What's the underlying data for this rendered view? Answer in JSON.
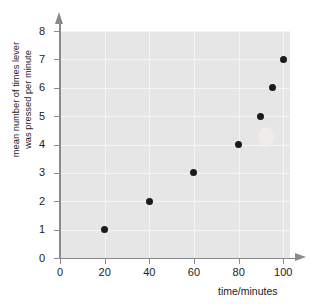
{
  "chart_data": {
    "type": "scatter",
    "title": "",
    "xlabel": "time/minutes",
    "ylabel_line1": "mean number of times lever",
    "ylabel_line2": "was pressed per minute",
    "x": [
      20,
      40,
      60,
      80,
      90,
      95,
      100
    ],
    "values": [
      1,
      2,
      3,
      4,
      5,
      6,
      7
    ],
    "points": [
      {
        "x": 20,
        "y": 1
      },
      {
        "x": 40,
        "y": 2
      },
      {
        "x": 60,
        "y": 3
      },
      {
        "x": 80,
        "y": 4
      },
      {
        "x": 90,
        "y": 5
      },
      {
        "x": 95,
        "y": 6
      },
      {
        "x": 100,
        "y": 7
      }
    ],
    "xlim": [
      0,
      103
    ],
    "ylim": [
      0,
      8
    ],
    "xticks": [
      0,
      20,
      40,
      60,
      80,
      100
    ],
    "yticks": [
      0,
      1,
      2,
      3,
      4,
      5,
      6,
      7,
      8
    ],
    "xtick_labels": [
      "0",
      "20",
      "40",
      "60",
      "80",
      "100"
    ],
    "ytick_labels": [
      "0",
      "1",
      "2",
      "3",
      "4",
      "5",
      "6",
      "7",
      "8"
    ],
    "grid": true,
    "legend": null,
    "marker_color": "#1b1b1b",
    "plot_background": "#e6e6e6",
    "gridline_color": "#f4f4f4",
    "axis_color": "#8a8a8a"
  }
}
